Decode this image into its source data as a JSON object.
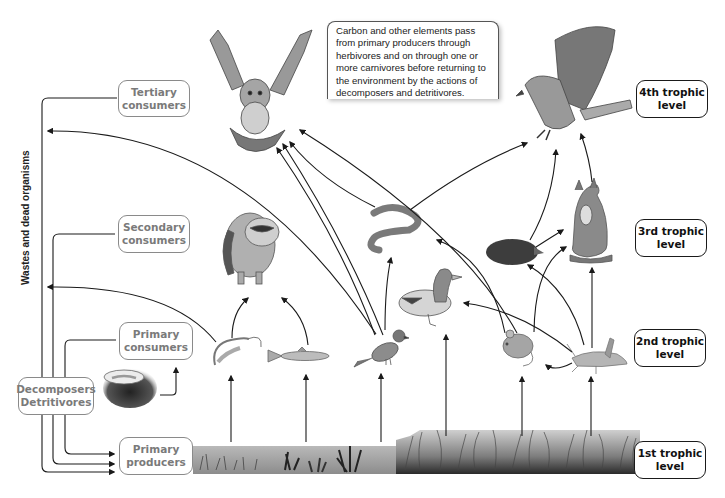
{
  "diagram": {
    "note": "Carbon and other elements pass from primary producers through herbivores and on through one or more carnivores before returning to the environment by the actions of decomposers and detritivores.",
    "side_label": "Wastes and dead organisms",
    "consumer_boxes": {
      "tertiary": "Tertiary consumers",
      "secondary": "Secondary consumers",
      "primary": "Primary consumers",
      "decomposers": "Decomposers Detritivores",
      "producers": "Primary producers"
    },
    "trophic_levels": {
      "fourth": "4th trophic level",
      "third": "3rd trophic level",
      "second": "2nd trophic level",
      "first": "1st trophic level"
    },
    "organisms": {
      "tertiary": [
        "owl",
        "hawk"
      ],
      "secondary": [
        "raccoon",
        "snake",
        "duck",
        "mole",
        "fox"
      ],
      "primary": [
        "shrimp",
        "fish",
        "sparrow",
        "mouse",
        "grasshopper"
      ],
      "decomposer": [
        "earthworm-in-soil"
      ],
      "producers": [
        "aquatic plants",
        "grassland"
      ]
    },
    "colors": {
      "gray_box_border": "#8a8a8a",
      "gray_box_text": "#7a7a7a",
      "dark_box_border": "#1a1a1a",
      "arrow": "#1a1a1a",
      "background": "#ffffff"
    }
  }
}
